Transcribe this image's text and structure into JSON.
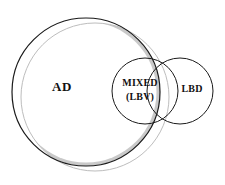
{
  "diagram": {
    "type": "venn-diagram",
    "title": "",
    "background_color": "#ffffff",
    "stroke_color": "#1a1a1a",
    "crescent_fill": "#c9c9c9",
    "circles": [
      {
        "id": "ad",
        "label": "AD",
        "label_line1": "AD",
        "cx": 86,
        "cy": 92,
        "r": 74,
        "fill": "none",
        "label_x": 62,
        "label_y": 88
      },
      {
        "id": "shadow",
        "label": "",
        "cx": 95,
        "cy": 97,
        "r": 74,
        "fill": "#c9c9c9"
      },
      {
        "id": "mixed",
        "label": "MIXED (LBV)",
        "label_line1": "MIXED",
        "label_line2": "(LBV)",
        "cx": 145,
        "cy": 91,
        "r": 33,
        "fill": "none",
        "label_x": 140,
        "label_y": 86
      },
      {
        "id": "lbd",
        "label": "LBD",
        "label_line1": "LBD",
        "cx": 180,
        "cy": 91,
        "r": 33,
        "fill": "none",
        "label_x": 192,
        "label_y": 90
      }
    ],
    "labels": {
      "ad": "AD",
      "mixed_line1": "MIXED",
      "mixed_line2": "(LBV)",
      "lbd": "LBD"
    }
  }
}
